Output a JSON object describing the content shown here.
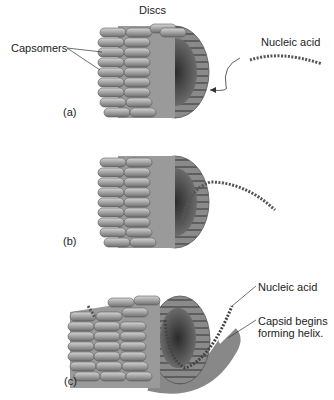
{
  "figure": {
    "panels": [
      {
        "id": "a",
        "label": "(a)",
        "annotations": {
          "discs": "Discs",
          "capsomers": "Capsomers",
          "nucleic_acid": "Nucleic acid"
        }
      },
      {
        "id": "b",
        "label": "(b)"
      },
      {
        "id": "c",
        "label": "(c)",
        "annotations": {
          "nucleic_acid": "Nucleic acid",
          "capsid_line1": "Capsid begins",
          "capsid_line2": "forming helix."
        }
      }
    ],
    "colors": {
      "capsomer_light": "#b8b8b8",
      "capsomer_mid": "#8c8c8c",
      "capsomer_dark": "#5a5a5a",
      "interior": "#3a3a3a",
      "line": "#333333"
    }
  }
}
